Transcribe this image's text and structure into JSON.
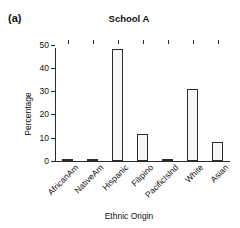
{
  "figure": {
    "panel_label": "(a)",
    "title": "School A"
  },
  "chart_data": {
    "type": "bar",
    "title": "School A",
    "xlabel": "Ethnic Origin",
    "ylabel": "Percentage",
    "categories": [
      "AfricanAm",
      "NativeAm",
      "Hispanic",
      "Filipino",
      "PacificIslnd",
      "White",
      "Asian"
    ],
    "values": [
      1.0,
      0.7,
      48.0,
      11.5,
      0.5,
      31.0,
      8.0
    ],
    "ylim": [
      0,
      52
    ],
    "yticks": [
      0,
      10,
      20,
      30,
      40,
      50
    ],
    "ytick_labels": [
      "0",
      "10",
      "20",
      "30",
      "40",
      "50"
    ],
    "grid": false,
    "legend": "none",
    "bar_fill_color": "#f7f7f7",
    "bar_edge_color": "#2b2b2b",
    "background_color": "#ffffff"
  }
}
